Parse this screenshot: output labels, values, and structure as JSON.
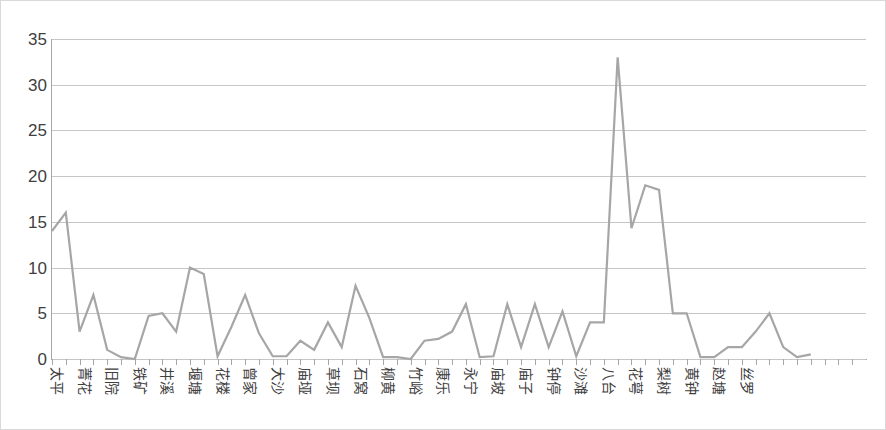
{
  "chart_data": {
    "type": "line",
    "title": "",
    "subtitle": "",
    "xlabel": "",
    "ylabel": "",
    "ylim": [
      0,
      35
    ],
    "y_ticks": [
      0,
      5,
      10,
      15,
      20,
      25,
      30,
      35
    ],
    "grid": true,
    "legend": false,
    "legend_position": "none",
    "line_color": "#a6a6a6",
    "categories": [
      "太平",
      "青山",
      "菁花",
      "黄土",
      "旧院",
      "岩脚",
      "铁矿",
      "新场",
      "井溪",
      "长田",
      "堰塘",
      "大寨",
      "花楼",
      "木黄",
      "曾家",
      "坪上",
      "大沙",
      "沙坝",
      "庙垭",
      "新华",
      "草坝",
      "双河",
      "石窝",
      "凉水",
      "柳黄",
      "马岩",
      "竹峪",
      "中寨",
      "康乐",
      "白果",
      "永宁",
      "高山",
      "庙坡",
      "龙塘",
      "庙子",
      "水口",
      "钟停",
      "茶园",
      "沙滩",
      "河坝",
      "八台",
      "长坡",
      "花萼",
      "金星",
      "梨树",
      "红岩",
      "黄钟",
      "团山",
      "赵塘",
      "桐子",
      "丝罗",
      "麻园",
      "杨柳"
    ],
    "x_tick_labels_shown": [
      "太平",
      "菁花",
      "旧院",
      "铁矿",
      "井溪",
      "堰塘",
      "花楼",
      "曾家",
      "大沙",
      "庙垭",
      "草坝",
      "石窝",
      "柳黄",
      "竹峪",
      "康乐",
      "永宁",
      "庙坡",
      "庙子",
      "钟停",
      "沙滩",
      "八台",
      "花萼",
      "梨树",
      "黄钟",
      "赵塘",
      "丝罗"
    ],
    "values": [
      14,
      16,
      3,
      7,
      1,
      0.2,
      0,
      4.7,
      5,
      3,
      10,
      9.3,
      0.3,
      3.5,
      7,
      2.8,
      0.3,
      0.3,
      2,
      1,
      4,
      1.3,
      8,
      4.5,
      0.2,
      0.2,
      0,
      2,
      2.2,
      3,
      6,
      0.2,
      0.3,
      6,
      1.3,
      6,
      1.3,
      5.2,
      0.3,
      4,
      4,
      33,
      14.3,
      19,
      18.5,
      5,
      5,
      0.2,
      0.2,
      1.3,
      1.3,
      3,
      5
    ],
    "tail_values": [
      1.3,
      0.2,
      0.5
    ]
  }
}
